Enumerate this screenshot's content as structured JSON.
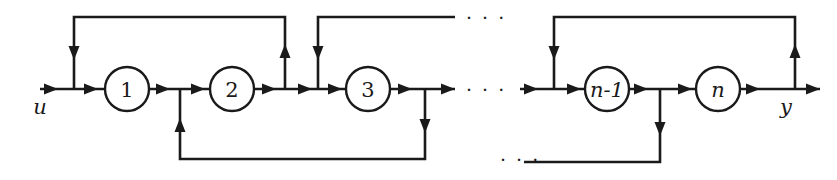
{
  "figure": {
    "kind": "block-diagram",
    "width": 837,
    "height": 180,
    "background_color": "#ffffff",
    "line_color": "#1a1a1a"
  },
  "nodes": [
    {
      "id": "node-1",
      "label": "1",
      "cx": 127,
      "cy": 89,
      "r": 22,
      "italic": false
    },
    {
      "id": "node-2",
      "label": "2",
      "cx": 232,
      "cy": 89,
      "r": 22,
      "italic": false
    },
    {
      "id": "node-3",
      "label": "3",
      "cx": 368,
      "cy": 89,
      "r": 22,
      "italic": false
    },
    {
      "id": "node-n-1",
      "label": "n-1",
      "cx": 607,
      "cy": 89,
      "r": 22,
      "italic": true
    },
    {
      "id": "node-n",
      "label": "n",
      "cx": 718,
      "cy": 89,
      "r": 22,
      "italic": true
    }
  ],
  "io": {
    "input_label": "u",
    "input_x": 40,
    "input_y": 107,
    "output_label": "y",
    "output_x": 786,
    "output_y": 107
  },
  "ellipses": [
    {
      "id": "ellipsis-top",
      "text": "· · ·",
      "x": 466,
      "y": 23
    },
    {
      "id": "ellipsis-main-left",
      "text": "· · ·",
      "x": 466,
      "y": 95
    },
    {
      "id": "ellipsis-main-right",
      "text": "· · ·",
      "x": 500,
      "y": 164
    },
    {
      "id": "ellipsis-bottom-right",
      "text": "· · ·",
      "x": 500,
      "y": 164
    }
  ],
  "geometry": {
    "main_line_y": 89,
    "top_feedback_y": 17,
    "bottom_feedback_y": 159,
    "input_start_x": 40,
    "output_end_x": 820
  },
  "feedback_loops": [
    {
      "id": "loop-top-1",
      "from_x": 285,
      "to_x": 74,
      "y": 17,
      "direction": "down-at-left"
    },
    {
      "id": "loop-top-2",
      "from_x": 453,
      "to_x": 318,
      "y": 17,
      "direction": "down-at-left"
    },
    {
      "id": "loop-top-3",
      "from_x": 795,
      "to_x": 554,
      "y": 17,
      "direction": "down-at-left"
    },
    {
      "id": "loop-bottom-1",
      "from_x": 425,
      "to_x": 180,
      "y": 159,
      "direction": "up-at-left"
    },
    {
      "id": "loop-bottom-2",
      "from_x": 660,
      "to_x": 524,
      "y": 162,
      "direction": "up-at-left"
    }
  ]
}
